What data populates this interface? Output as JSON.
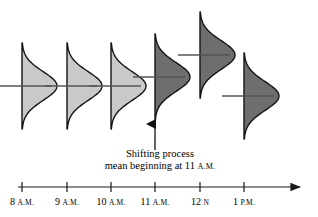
{
  "figure": {
    "caption_line1": "Shifting process",
    "caption_line2_pre": "mean beginning at 11",
    "caption_line2_sc": "A.M."
  },
  "chart_data": {
    "type": "area",
    "title": "",
    "xlabel": "",
    "ylabel": "",
    "categories": [
      "8 A.M.",
      "9 A.M.",
      "10 A.M.",
      "11 A.M.",
      "12 N",
      "1 P.M."
    ],
    "tick_labels": [
      {
        "num": "8",
        "suffix": "A.M."
      },
      {
        "num": "9",
        "suffix": "A.M."
      },
      {
        "num": "10",
        "suffix": "A.M."
      },
      {
        "num": "11",
        "suffix": "A.M."
      },
      {
        "num": "12",
        "suffix": "N"
      },
      {
        "num": "1",
        "suffix": "P.M."
      }
    ],
    "x_positions": [
      22,
      67,
      111,
      155,
      200,
      244
    ],
    "mean_y": [
      86,
      86,
      86,
      77,
      55,
      96
    ],
    "fill_colors": [
      "#c9c9c9",
      "#c9c9c9",
      "#c9c9c9",
      "#6e6e6e",
      "#6e6e6e",
      "#6e6e6e"
    ],
    "shifted": [
      false,
      false,
      false,
      true,
      true,
      true
    ],
    "curve_half_height": 43,
    "curve_peak_width": 35,
    "mean_line_length": 60,
    "axis": {
      "y": 187,
      "x_start": 18,
      "x_end": 300,
      "grid": false,
      "arrow": true
    },
    "annotation": {
      "type": "up-arrow",
      "x": 155,
      "y_tail": 150,
      "y_head": 124
    },
    "legend": []
  }
}
